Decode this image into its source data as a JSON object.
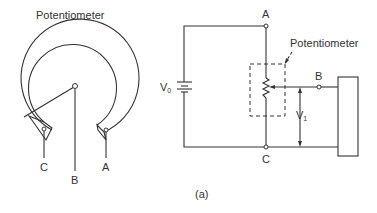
{
  "left_diagram": {
    "title": "Potentiometer",
    "terminals": {
      "a": "A",
      "b": "B",
      "c": "C"
    }
  },
  "right_diagram": {
    "potentiometer_label": "Potentiometer",
    "node_a": "A",
    "node_b": "B",
    "node_c": "C",
    "source_label": "V",
    "source_sub": "0",
    "output_label": "V",
    "output_sub": "1"
  },
  "caption": "(a)"
}
